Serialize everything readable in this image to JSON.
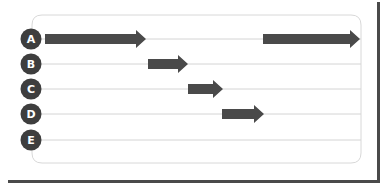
{
  "colors": {
    "arrow": "#4a4a4a",
    "circle": "#3e3e3e",
    "circle_text": "#ffffff",
    "gridline": "#d4d4d4",
    "card_border": "#d8d8d8",
    "frame": "#4a4a4a"
  },
  "rows": [
    {
      "label": "A",
      "y": 39
    },
    {
      "label": "B",
      "y": 64
    },
    {
      "label": "C",
      "y": 89
    },
    {
      "label": "D",
      "y": 114
    },
    {
      "label": "E",
      "y": 140
    }
  ],
  "arrows": [
    {
      "row": "A",
      "x_start": 45,
      "x_end": 146
    },
    {
      "row": "A",
      "x_start": 263,
      "x_end": 360
    },
    {
      "row": "B",
      "x_start": 148,
      "x_end": 188
    },
    {
      "row": "C",
      "x_start": 188,
      "x_end": 223
    },
    {
      "row": "D",
      "x_start": 222,
      "x_end": 264
    }
  ]
}
